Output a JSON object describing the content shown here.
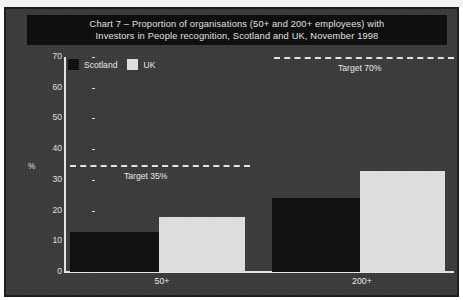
{
  "document": {
    "scan_strip_present": true
  },
  "title": {
    "line1": "Chart 7 – Proportion of organisations (50+ and 200+ employees) with",
    "line2": "Investors in People recognition, Scotland and UK, November 1998"
  },
  "legend": {
    "items": [
      {
        "label": "Scotland",
        "color": "#0d0d0d"
      },
      {
        "label": "UK",
        "color": "#e2e2e2"
      }
    ]
  },
  "axis": {
    "y_unit_label": "%",
    "y_ticks": [
      "0",
      "10",
      "20",
      "30",
      "40",
      "50",
      "60",
      "70"
    ]
  },
  "targets": [
    {
      "label": "Target 35%",
      "value": 35
    },
    {
      "label": "Target 70%",
      "value": 70
    }
  ],
  "chart_data": {
    "type": "bar",
    "title": "Chart 7 – Proportion of organisations (50+ and 200+ employees) with Investors in People recognition, Scotland and UK, November 1998",
    "xlabel": "",
    "ylabel": "%",
    "ylim": [
      0,
      70
    ],
    "ytick_step": 10,
    "grid": false,
    "legend_position": "top-left",
    "categories": [
      "50+",
      "200+"
    ],
    "series": [
      {
        "name": "Scotland",
        "color": "#0d0d0d",
        "values": [
          13,
          24
        ]
      },
      {
        "name": "UK",
        "color": "#e2e2e2",
        "values": [
          18,
          33
        ]
      }
    ],
    "annotations": [
      {
        "type": "hline",
        "label": "Target 35%",
        "value": 35,
        "style": "dashed",
        "span": "left-group"
      },
      {
        "type": "hline",
        "label": "Target 70%",
        "value": 70,
        "style": "dashed",
        "span": "right-group"
      }
    ]
  }
}
